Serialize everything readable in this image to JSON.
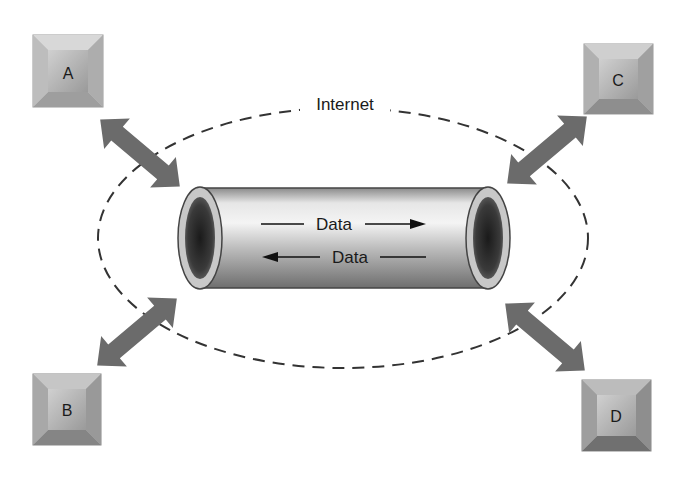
{
  "diagram": {
    "cloud_label": "Internet",
    "tunnel": {
      "forward_label": "Data",
      "reverse_label": "Data"
    },
    "nodes": [
      {
        "id": "A",
        "label": "A"
      },
      {
        "id": "B",
        "label": "B"
      },
      {
        "id": "C",
        "label": "C"
      },
      {
        "id": "D",
        "label": "D"
      }
    ],
    "colors": {
      "arrow": "#6b6b6b",
      "node_face": "#b9b9b9",
      "dashed_ellipse": "#333333"
    }
  }
}
